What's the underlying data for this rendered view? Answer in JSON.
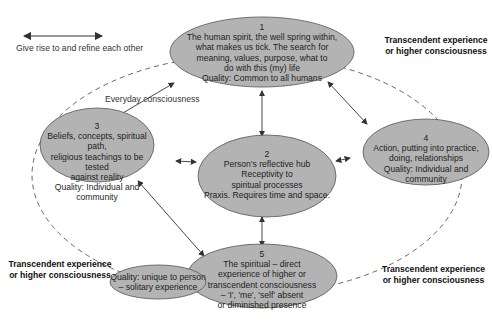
{
  "legend": {
    "arrow_icon": "double-headed-arrow",
    "text": "Give rise to and refine each other"
  },
  "everyday_label": "Everyday consciousness",
  "transcendent_labels": [
    {
      "line1": "Transcendent experience",
      "line2": "or higher consciousness"
    },
    {
      "line1": "Transcendent experience",
      "line2": "or higher consciousness"
    },
    {
      "line1": "Transcendent experience",
      "line2": "or higher consciousness"
    }
  ],
  "nodes": [
    {
      "num": "1",
      "lines": [
        "The human spirit, the well spring within,",
        "what makes us tick. The search for",
        "meaning, values, purpose, what to",
        "do with this (my) life",
        "Quality: Common to all humans"
      ]
    },
    {
      "num": "2",
      "lines": [
        "Person's reflective hub",
        "Receptivity to",
        "spiritual processes",
        "Praxis. Requires time and space."
      ]
    },
    {
      "num": "3",
      "lines": [
        "Beliefs, concepts, spiritual path,",
        "religious teachings to be tested",
        "against reality",
        "Quality: Individual and community"
      ]
    },
    {
      "num": "4",
      "lines": [
        "Action, putting into practice,",
        "doing, relationships",
        "Quality: Individual and community"
      ]
    },
    {
      "num": "5",
      "lines": [
        "The spiritual – direct",
        "experience of higher or",
        "transcendent consciousness",
        "– 'I', 'me', 'self' absent",
        "or diminished presence"
      ]
    }
  ],
  "side_node": {
    "lines": [
      "Quality: unique to person",
      "– solitary experience"
    ]
  },
  "colors": {
    "node_fill": "#b3b3b3",
    "node_stroke": "#555555",
    "arrow": "#333333",
    "dashed": "#555555"
  }
}
